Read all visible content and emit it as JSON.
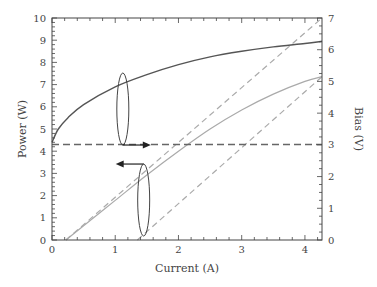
{
  "chart_data": {
    "type": "line",
    "title": "",
    "xlabel": "Current (A)",
    "ylabel_left": "Power (W)",
    "ylabel_right": "Bias (V)",
    "xlim": [
      0,
      4.27
    ],
    "ylim_left": [
      0,
      10
    ],
    "ylim_right": [
      0,
      7
    ],
    "x_ticks": [
      "0",
      "1",
      "2",
      "3",
      "4"
    ],
    "y_left_ticks": [
      "0",
      "1",
      "2",
      "3",
      "4",
      "5",
      "6",
      "7",
      "8",
      "9",
      "10"
    ],
    "y_right_ticks": [
      "0",
      "1",
      "2",
      "3",
      "4",
      "5",
      "6",
      "7"
    ],
    "grid": false,
    "series": [
      {
        "name": "Power",
        "axis": "left",
        "style": "solid-dark",
        "x": [
          0,
          0.1,
          0.25,
          0.5,
          1.0,
          1.5,
          2.0,
          2.5,
          3.0,
          3.5,
          4.0,
          4.27
        ],
        "y": [
          4.4,
          5.0,
          5.5,
          6.1,
          6.9,
          7.45,
          7.9,
          8.25,
          8.5,
          8.7,
          8.85,
          8.95
        ]
      },
      {
        "name": "Bias",
        "axis": "right",
        "style": "solid-gray",
        "x": [
          0.22,
          0.5,
          1.0,
          1.5,
          2.0,
          2.5,
          3.0,
          3.5,
          4.0,
          4.27
        ],
        "y": [
          0,
          0.45,
          1.25,
          2.05,
          2.8,
          3.5,
          4.1,
          4.6,
          5.0,
          5.15
        ]
      },
      {
        "name": "Bias linear fit (upper)",
        "axis": "right",
        "style": "dashed-gray",
        "x": [
          0.22,
          4.27
        ],
        "y": [
          0,
          7.0
        ]
      },
      {
        "name": "Bias linear fit (lower)",
        "axis": "right",
        "style": "dashed-gray",
        "x": [
          1.35,
          4.27
        ],
        "y": [
          0,
          5.15
        ]
      },
      {
        "name": "Power threshold",
        "axis": "left",
        "style": "dashed-dark",
        "x": [
          0,
          4.27
        ],
        "y": [
          4.3,
          4.3
        ]
      }
    ],
    "annotations": [
      {
        "type": "ellipse",
        "target": "Power",
        "arrow": "right",
        "x": 1.12,
        "y_left_center": 5.9
      },
      {
        "type": "ellipse",
        "target": "Bias",
        "arrow": "left",
        "x": 1.45,
        "y_left_center": 1.8
      }
    ]
  }
}
